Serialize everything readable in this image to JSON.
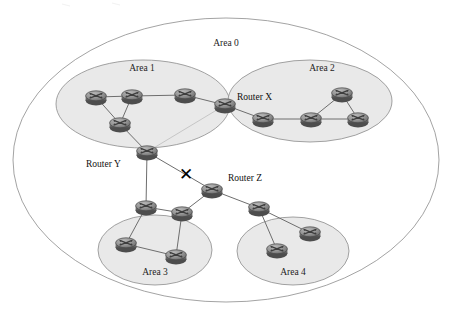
{
  "diagram": {
    "canvas": {
      "width": 450,
      "height": 318
    },
    "colors": {
      "background": "#ffffff",
      "area_fill": "#e9e9e9",
      "area0_fill": "#ffffff",
      "area_stroke": "#8b8b8b",
      "link_stroke": "#6e6e6e",
      "router_body": "#9a9a9a",
      "router_dark": "#5d5d5d",
      "router_edge": "#4a4a4a",
      "text": "#1a1a1a",
      "break_mark": "#000000"
    },
    "areas": [
      {
        "id": "area0",
        "label": "Area 0",
        "label_x": 226,
        "label_y": 46,
        "cx": 226,
        "cy": 160,
        "rx": 213,
        "ry": 142,
        "filled": false
      },
      {
        "id": "area1",
        "label": "Area 1",
        "label_x": 142,
        "label_y": 71,
        "cx": 143,
        "cy": 104,
        "rx": 87,
        "ry": 44,
        "filled": true
      },
      {
        "id": "area2",
        "label": "Area 2",
        "label_x": 322,
        "label_y": 71,
        "cx": 310,
        "cy": 101,
        "rx": 82,
        "ry": 41,
        "filled": true
      },
      {
        "id": "area3",
        "label": "Area 3",
        "label_x": 155,
        "label_y": 275,
        "cx": 155,
        "cy": 250,
        "rx": 57,
        "ry": 35,
        "filled": true
      },
      {
        "id": "area4",
        "label": "Area 4",
        "label_x": 293,
        "label_y": 275,
        "cx": 293,
        "cy": 251,
        "rx": 56,
        "ry": 34,
        "filled": true
      }
    ],
    "routers": [
      {
        "id": "a1r1",
        "x": 96,
        "y": 97,
        "area": "area1"
      },
      {
        "id": "a1r2",
        "x": 132,
        "y": 96,
        "area": "area1"
      },
      {
        "id": "a1r3",
        "x": 185,
        "y": 95,
        "area": "area1"
      },
      {
        "id": "a1r4",
        "x": 120,
        "y": 124,
        "area": "area1"
      },
      {
        "id": "routerX",
        "x": 225,
        "y": 105,
        "area": "area0"
      },
      {
        "id": "a2r1",
        "x": 263,
        "y": 119,
        "area": "area2"
      },
      {
        "id": "a2r2",
        "x": 311,
        "y": 119,
        "area": "area2"
      },
      {
        "id": "a2r3",
        "x": 342,
        "y": 94,
        "area": "area2"
      },
      {
        "id": "a2r4",
        "x": 358,
        "y": 119,
        "area": "area2"
      },
      {
        "id": "routerY",
        "x": 147,
        "y": 152,
        "area": "area0"
      },
      {
        "id": "routerZ",
        "x": 212,
        "y": 190,
        "area": "area0"
      },
      {
        "id": "a3r1",
        "x": 146,
        "y": 207,
        "area": "area3"
      },
      {
        "id": "a3r2",
        "x": 182,
        "y": 213,
        "area": "area3"
      },
      {
        "id": "a3r3",
        "x": 126,
        "y": 244,
        "area": "area3"
      },
      {
        "id": "a3r4",
        "x": 176,
        "y": 256,
        "area": "area3"
      },
      {
        "id": "a4r1",
        "x": 259,
        "y": 208,
        "area": "area4"
      },
      {
        "id": "a4r2",
        "x": 310,
        "y": 233,
        "area": "area4"
      },
      {
        "id": "a4r3",
        "x": 277,
        "y": 250,
        "area": "area4"
      }
    ],
    "links": [
      {
        "from": "a1r1",
        "to": "a1r2"
      },
      {
        "from": "a1r2",
        "to": "a1r3"
      },
      {
        "from": "a1r1",
        "to": "a1r4"
      },
      {
        "from": "a1r2",
        "to": "a1r4"
      },
      {
        "from": "a1r3",
        "to": "routerX"
      },
      {
        "from": "a1r4",
        "to": "routerY"
      },
      {
        "from": "routerX",
        "to": "routerY",
        "style": "faint"
      },
      {
        "from": "routerX",
        "to": "a2r1"
      },
      {
        "from": "a2r1",
        "to": "a2r2"
      },
      {
        "from": "a2r2",
        "to": "a2r3"
      },
      {
        "from": "a2r3",
        "to": "a2r4"
      },
      {
        "from": "a2r2",
        "to": "a2r4"
      },
      {
        "from": "routerY",
        "to": "routerZ",
        "broken": true
      },
      {
        "from": "routerY",
        "to": "a3r1"
      },
      {
        "from": "routerZ",
        "to": "a3r2"
      },
      {
        "from": "routerZ",
        "to": "a4r1"
      },
      {
        "from": "a3r1",
        "to": "a3r2"
      },
      {
        "from": "a3r1",
        "to": "a3r3"
      },
      {
        "from": "a3r2",
        "to": "a3r4"
      },
      {
        "from": "a3r3",
        "to": "a3r4"
      },
      {
        "from": "a4r1",
        "to": "a4r2"
      },
      {
        "from": "a4r1",
        "to": "a4r3"
      }
    ],
    "router_labels": [
      {
        "id": "routerX",
        "text": "Router X",
        "x": 237,
        "y": 100
      },
      {
        "id": "routerY",
        "text": "Router Y",
        "x": 86,
        "y": 167
      },
      {
        "id": "routerZ",
        "text": "Router Z",
        "x": 228,
        "y": 181
      }
    ],
    "break_mark": {
      "symbol": "✕",
      "x": 186,
      "y": 180
    }
  }
}
